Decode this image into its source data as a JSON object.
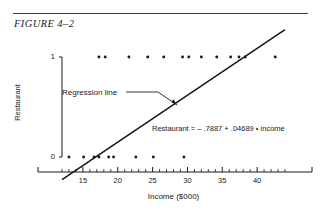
{
  "figure": {
    "title": "FIGURE 4–2",
    "rule_color": "#3a3a3a"
  },
  "annotations": {
    "regression_label": "Regression line",
    "equation": "Restaurant  =  – .7887 + .04689 • income"
  },
  "chart_data": {
    "type": "scatter",
    "title": "FIGURE 4–2",
    "xlabel": "Income ($000)",
    "ylabel": "Restaurant",
    "xlim": [
      12,
      44
    ],
    "ylim": [
      0,
      1
    ],
    "grid": false,
    "legend": null,
    "xticks": [
      15,
      20,
      25,
      30,
      35,
      40
    ],
    "xtick_labels": [
      "15",
      "20",
      "25",
      "30",
      "35",
      "40"
    ],
    "xminor_step": 1,
    "yticks": [
      0,
      1
    ],
    "ytick_labels": [
      "0",
      "1"
    ],
    "series": [
      {
        "name": "Observations",
        "marker": "dot",
        "color": "#1a1a1a",
        "points": [
          {
            "x": 17.3,
            "y": 1
          },
          {
            "x": 18.2,
            "y": 1
          },
          {
            "x": 21.6,
            "y": 1
          },
          {
            "x": 24.3,
            "y": 1
          },
          {
            "x": 26.6,
            "y": 1
          },
          {
            "x": 29.3,
            "y": 1
          },
          {
            "x": 30.2,
            "y": 1
          },
          {
            "x": 32.0,
            "y": 1
          },
          {
            "x": 34.2,
            "y": 1
          },
          {
            "x": 36.2,
            "y": 1
          },
          {
            "x": 37.4,
            "y": 1
          },
          {
            "x": 38.3,
            "y": 1
          },
          {
            "x": 42.6,
            "y": 1
          },
          {
            "x": 13.0,
            "y": 0
          },
          {
            "x": 15.1,
            "y": 0
          },
          {
            "x": 16.6,
            "y": 0
          },
          {
            "x": 17.3,
            "y": 0
          },
          {
            "x": 18.7,
            "y": 0
          },
          {
            "x": 19.4,
            "y": 0
          },
          {
            "x": 22.6,
            "y": 0
          },
          {
            "x": 25.1,
            "y": 0
          },
          {
            "x": 29.5,
            "y": 0
          }
        ]
      }
    ],
    "fit_line": {
      "name": "Regression line",
      "intercept": -0.7887,
      "slope": 0.04689,
      "equation": "Restaurant  =  – .7887 + .04689 • income",
      "x_start": 12.0,
      "x_end": 44.0,
      "color": "#111111"
    }
  }
}
